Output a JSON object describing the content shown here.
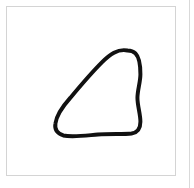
{
  "canvas": {
    "width": 194,
    "height": 188,
    "background_color": "#ffffff",
    "title": "Drawing canvas"
  },
  "frame": {
    "label": "Drawing frame",
    "border_color": "#d4d4d4",
    "fill_color": "#ffffff",
    "x": 6,
    "y": 6,
    "width": 170,
    "height": 170
  },
  "divider": {
    "label": "Panel divider",
    "color": "#d9d9d9",
    "x": 189
  },
  "shape": {
    "name": "hand-drawn closed blob",
    "description": "Irregular hand-drawn closed outline resembling a fin or rounded triangle",
    "stroke_color": "#111111",
    "stroke_width": 4,
    "fill": "none",
    "path": "M 122 44 C 112 42 104 48 96 56 C 86 66 74 80 64 92 C 56 101 50 110 49 118 C 48 124 51 128 57 130 C 66 132 80 130 92 129 C 104 128 118 129 126 128 C 132 127 135 123 135 116 C 135 108 132 100 132 92 C 132 84 135 76 135 68 C 135 58 133 50 130 47 C 128 45 125 44 122 44 Z"
  }
}
